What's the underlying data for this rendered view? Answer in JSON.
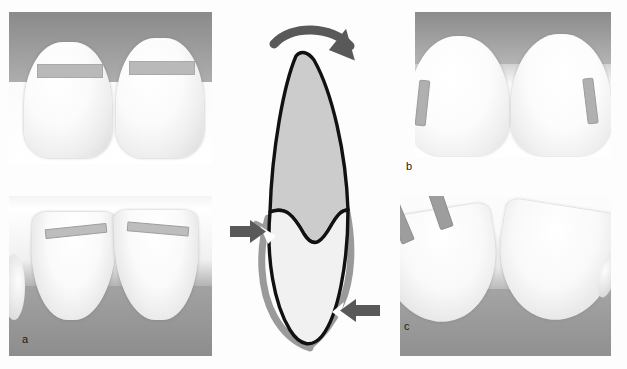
{
  "figure": {
    "background_color": "#fdfdfd",
    "width": 627,
    "height": 369
  },
  "panels": [
    {
      "id": "a-top",
      "letter": "",
      "view": "facial view of two central incisors with horizontal gray bands",
      "band_count": 2,
      "band_orientation": "horizontal"
    },
    {
      "id": "a-bottom",
      "letter": "a",
      "view": "incisal view of two central incisors with gray bands on incisal edges",
      "band_count": 2,
      "band_orientation": "horizontal"
    },
    {
      "id": "b",
      "letter": "b",
      "view": "facial view of two central incisors with vertical gray strips at proximal surfaces",
      "band_count": 2,
      "band_orientation": "vertical"
    },
    {
      "id": "c",
      "letter": "c",
      "view": "angled incisal view of two central incisors with two gray bands on each incisal edge",
      "band_count": 4,
      "band_orientation": "oblique"
    }
  ],
  "labels": {
    "a": "a",
    "b": "b",
    "c": "c"
  },
  "diagram": {
    "name": "tooth-cross-section-schematic",
    "crown_fill": "#cccccc",
    "root_fill": "#f0f0f0",
    "outline_color": "#111111",
    "overlay_color": "#9a9a9a",
    "arrow_color": "#595959",
    "rotation_arrow": {
      "name": "rotation-arrow",
      "direction": "clockwise",
      "position": "top"
    },
    "pointer_arrows": [
      {
        "name": "left-pointer-arrow",
        "direction": "right",
        "points_to": "gap-in-outline-left"
      },
      {
        "name": "right-pointer-arrow",
        "direction": "left",
        "points_to": "gap-in-outline-right"
      }
    ]
  },
  "colors": {
    "band_gray": "#b9b9b9",
    "band_gray_dark": "#9d9d9d",
    "gum_gray": "#8e8e8e",
    "tooth_white": "#ffffff",
    "diagram_gray": "#cccccc",
    "arrow_gray": "#595959"
  }
}
